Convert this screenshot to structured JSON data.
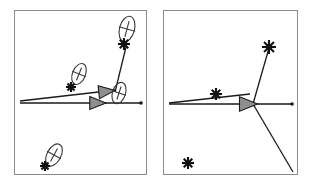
{
  "figure": {
    "title": "",
    "type": "two-panel-vector-diagram",
    "width": 311,
    "height": 184,
    "background_color": "#ffffff",
    "panel_border_color": "#8c8c8c",
    "line_color": "#1a1a1a",
    "ellipse_color": "#3a3a3a",
    "marker_color": "#111111",
    "arrowhead_fill": "#8f8f8f",
    "arrowhead_stroke": "#1a1a1a"
  },
  "panels": [
    {
      "id": "panel-left",
      "label": "left",
      "frame": {
        "x": 14,
        "y": 10,
        "width": 132,
        "height": 164
      },
      "vectors": [
        {
          "name": "main-horizontal-vector",
          "x1": 20,
          "y1": 103,
          "x2": 141,
          "y2": 103,
          "arrowhead": {
            "x": 101,
            "y": 103,
            "angle": 0,
            "size": 9
          },
          "endpoint_dot": true
        },
        {
          "name": "tilted-vector",
          "x1": 20,
          "y1": 101,
          "x2": 116,
          "y2": 90,
          "arrowhead": {
            "x": 110,
            "y": 91,
            "angle": -6,
            "size": 9
          },
          "endpoint_dot": false
        },
        {
          "name": "upward-link-line",
          "x1": 115,
          "y1": 92,
          "x2": 126,
          "y2": 47,
          "arrowhead": null,
          "endpoint_dot": false
        }
      ],
      "ellipses": [
        {
          "name": "ellipse-top-right",
          "cx": 127,
          "cy": 29,
          "rx": 7.5,
          "ry": 13,
          "rotation": 15,
          "cross": true
        },
        {
          "name": "ellipse-middle",
          "cx": 79,
          "cy": 74,
          "rx": 6.5,
          "ry": 11,
          "rotation": 22,
          "cross": true
        },
        {
          "name": "ellipse-arrowhead",
          "cx": 119,
          "cy": 93,
          "rx": 6.5,
          "ry": 11,
          "rotation": 18,
          "cross": true
        },
        {
          "name": "ellipse-bottom-left",
          "cx": 54,
          "cy": 155,
          "rx": 7,
          "ry": 12,
          "rotation": 28,
          "cross": true
        }
      ],
      "stars": [
        {
          "name": "star-top-right",
          "cx": 124,
          "cy": 44,
          "size": 6
        },
        {
          "name": "star-middle",
          "cx": 71,
          "cy": 87,
          "size": 5
        },
        {
          "name": "star-bottom-left",
          "cx": 45,
          "cy": 166,
          "size": 5
        }
      ]
    },
    {
      "id": "panel-right",
      "label": "right",
      "frame": {
        "x": 163,
        "y": 10,
        "width": 134,
        "height": 164
      },
      "vectors": [
        {
          "name": "main-horizontal-vector",
          "x1": 169,
          "y1": 104,
          "x2": 292,
          "y2": 104,
          "arrowhead": {
            "x": 252,
            "y": 104,
            "angle": 0,
            "size": 10
          },
          "endpoint_dot": true
        },
        {
          "name": "tilted-vector",
          "x1": 169,
          "y1": 103,
          "x2": 250,
          "y2": 94,
          "arrowhead": null,
          "endpoint_dot": false
        },
        {
          "name": "upper-branch-line",
          "x1": 253,
          "y1": 104,
          "x2": 269,
          "y2": 48,
          "arrowhead": null,
          "endpoint_dot": false
        },
        {
          "name": "lower-branch-line",
          "x1": 253,
          "y1": 104,
          "x2": 293,
          "y2": 172,
          "arrowhead": null,
          "endpoint_dot": false
        }
      ],
      "ellipses": [],
      "stars": [
        {
          "name": "star-upper",
          "cx": 269,
          "cy": 47,
          "size": 7
        },
        {
          "name": "star-middle",
          "cx": 216,
          "cy": 94,
          "size": 6
        },
        {
          "name": "star-lower-left",
          "cx": 188,
          "cy": 163,
          "size": 6
        }
      ]
    }
  ]
}
